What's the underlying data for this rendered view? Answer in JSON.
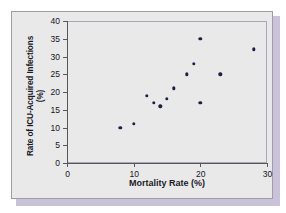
{
  "figure": {
    "panel_background": "#e9e9ea",
    "panel_border": "#9d9dab",
    "shadow_color": "#c9c2d8",
    "marker_color": "#1f1f45",
    "axis_color": "#56565f"
  },
  "chart_data": {
    "type": "scatter",
    "title": "",
    "xlabel": "Mortality Rate (%)",
    "ylabel": "Rate of ICU-Acquired Infections (%)",
    "ylabel_lines": [
      "Rate of ICU-Acquired Infections",
      "(%)"
    ],
    "xlim": [
      0,
      30
    ],
    "ylim": [
      0,
      40
    ],
    "xticks": [
      0,
      10,
      20,
      30
    ],
    "yticks": [
      0,
      5,
      10,
      15,
      20,
      25,
      30,
      35,
      40
    ],
    "xtick_labels": [
      "0",
      "10",
      "20",
      "30"
    ],
    "ytick_labels": [
      "0",
      "5",
      "10",
      "15",
      "20",
      "25",
      "30",
      "35",
      "40"
    ],
    "grid": false,
    "legend": null,
    "series": [
      {
        "name": "ICU units",
        "marker": "filled-circle",
        "color": "#1f1f45",
        "points": [
          {
            "x": 8,
            "y": 10
          },
          {
            "x": 10,
            "y": 11
          },
          {
            "x": 12,
            "y": 19
          },
          {
            "x": 13,
            "y": 17
          },
          {
            "x": 14,
            "y": 16
          },
          {
            "x": 15,
            "y": 18
          },
          {
            "x": 16,
            "y": 21
          },
          {
            "x": 18,
            "y": 25
          },
          {
            "x": 19,
            "y": 28
          },
          {
            "x": 20,
            "y": 35
          },
          {
            "x": 20,
            "y": 17
          },
          {
            "x": 23,
            "y": 25
          },
          {
            "x": 28,
            "y": 32
          }
        ]
      }
    ]
  }
}
